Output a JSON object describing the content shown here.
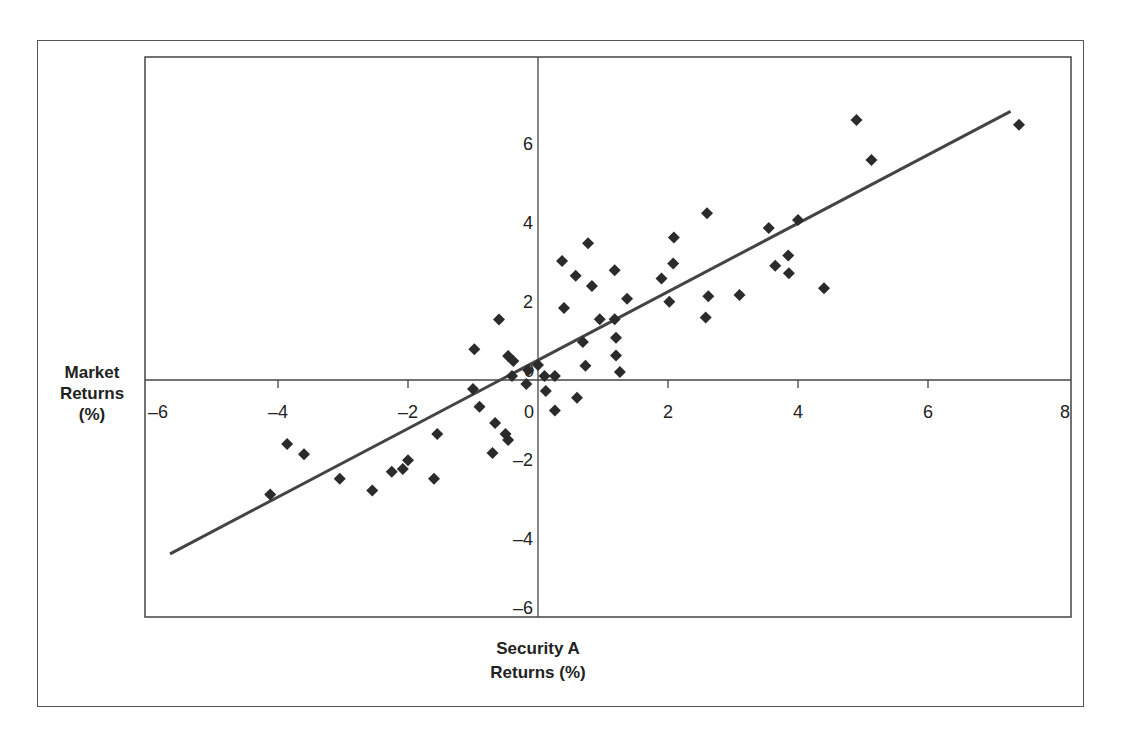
{
  "chart_data": {
    "type": "scatter",
    "title": "",
    "xlabel": "Security A Returns (%)",
    "ylabel": "Market Returns (%)",
    "xlim": [
      -6,
      8
    ],
    "ylim": [
      -6,
      8
    ],
    "grid": false,
    "x_ticks": [
      "-6",
      "-4",
      "-2",
      "0",
      "2",
      "4",
      "6",
      "8"
    ],
    "y_ticks": [
      "-6",
      "-4",
      "-2",
      "0",
      "2",
      "4",
      "6"
    ],
    "series": [
      {
        "name": "Observations",
        "marker": "diamond",
        "color": "#2b2b2b",
        "points": [
          [
            -4.12,
            -2.9
          ],
          [
            -3.86,
            -1.62
          ],
          [
            -3.6,
            -1.88
          ],
          [
            -3.05,
            -2.5
          ],
          [
            -2.55,
            -2.8
          ],
          [
            -2.25,
            -2.32
          ],
          [
            -2.08,
            -2.25
          ],
          [
            -2.0,
            -2.03
          ],
          [
            -1.6,
            -2.5
          ],
          [
            -1.55,
            -1.37
          ],
          [
            -1.0,
            -0.23
          ],
          [
            -0.98,
            0.78
          ],
          [
            -0.9,
            -0.68
          ],
          [
            -0.7,
            -1.85
          ],
          [
            -0.66,
            -1.09
          ],
          [
            -0.6,
            1.53
          ],
          [
            -0.5,
            -1.37
          ],
          [
            -0.46,
            -1.52
          ],
          [
            -0.46,
            0.61
          ],
          [
            -0.38,
            0.48
          ],
          [
            -0.4,
            0.1
          ],
          [
            -0.18,
            -0.1
          ],
          [
            -0.15,
            0.25
          ],
          [
            0.1,
            0.1
          ],
          [
            0.0,
            0.38
          ],
          [
            0.12,
            -0.28
          ],
          [
            0.26,
            -0.77
          ],
          [
            0.26,
            0.1
          ],
          [
            0.37,
            3.01
          ],
          [
            0.4,
            1.82
          ],
          [
            0.6,
            -0.45
          ],
          [
            0.58,
            2.64
          ],
          [
            0.69,
            0.96
          ],
          [
            0.73,
            0.36
          ],
          [
            0.77,
            3.46
          ],
          [
            0.83,
            2.38
          ],
          [
            0.95,
            1.54
          ],
          [
            1.18,
            1.54
          ],
          [
            1.18,
            2.78
          ],
          [
            1.2,
            0.62
          ],
          [
            1.2,
            1.07
          ],
          [
            1.26,
            0.2
          ],
          [
            1.37,
            2.06
          ],
          [
            1.9,
            2.57
          ],
          [
            2.02,
            1.98
          ],
          [
            2.09,
            3.61
          ],
          [
            2.08,
            2.95
          ],
          [
            2.6,
            4.22
          ],
          [
            2.58,
            1.58
          ],
          [
            2.62,
            2.12
          ],
          [
            3.1,
            2.15
          ],
          [
            3.65,
            2.89
          ],
          [
            3.55,
            3.85
          ],
          [
            3.86,
            2.7
          ],
          [
            3.85,
            3.15
          ],
          [
            4.0,
            4.05
          ],
          [
            4.4,
            2.32
          ],
          [
            4.9,
            6.58
          ],
          [
            5.13,
            5.57
          ],
          [
            7.4,
            6.46
          ]
        ]
      }
    ],
    "regression_line": {
      "x": [
        -5.66,
        7.27
      ],
      "y": [
        -4.4,
        6.8
      ]
    }
  },
  "labels": {
    "y_axis": [
      "Market",
      "Returns",
      "(%)"
    ],
    "x_axis": [
      "Security A",
      "Returns (%)"
    ]
  }
}
